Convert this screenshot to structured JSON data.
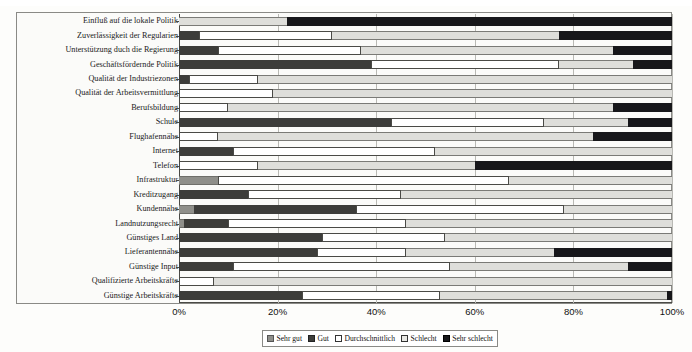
{
  "chart_data": {
    "type": "bar",
    "orientation": "horizontal",
    "stacked": true,
    "stack_mode": "percent",
    "title": "",
    "xlabel": "",
    "ylabel": "",
    "xlim": [
      0,
      100
    ],
    "grid": true,
    "legend_position": "bottom",
    "xticks": [
      "0%",
      "20%",
      "40%",
      "60%",
      "80%",
      "100%"
    ],
    "xtick_values": [
      0,
      20,
      40,
      60,
      80,
      100
    ],
    "series": [
      {
        "name": "Sehr gut",
        "color": "#8f8f8a"
      },
      {
        "name": "Gut",
        "color": "#3d3d3a"
      },
      {
        "name": "Durchschnittlich",
        "color": "#ffffff"
      },
      {
        "name": "Schlecht",
        "color": "#dededa"
      },
      {
        "name": "Sehr schlecht",
        "color": "#17171a"
      }
    ],
    "categories": [
      "Einfluß auf die lokale Politik",
      "Zuverlässigkeit der Regularien",
      "Unterstützung duch die Regierung",
      "Geschäftsfördernde Politik",
      "Qualität der Industriezonen",
      "Qualität der Arbeitsvermittlung",
      "Berufsbildung",
      "Schule",
      "Flughafennähe",
      "Internet",
      "Telefon",
      "Infrastruktur",
      "Kreditzugang",
      "Kundennähe",
      "Landnutzungsrecht",
      "Günstiges Land",
      "Lieferantennähe",
      "Günstige Input",
      "Qualifizierte Arbeitskräfte",
      "Günstige Arbeitskräfte"
    ],
    "values": [
      [
        0,
        0,
        0,
        22,
        78
      ],
      [
        0,
        4,
        27,
        46,
        23
      ],
      [
        0,
        8,
        29,
        51,
        12
      ],
      [
        0,
        39,
        38,
        15,
        8
      ],
      [
        0,
        2,
        14,
        84,
        0
      ],
      [
        0,
        0,
        19,
        81,
        0
      ],
      [
        0,
        0,
        10,
        78,
        12
      ],
      [
        0,
        43,
        31,
        17,
        9
      ],
      [
        0,
        0,
        8,
        76,
        16
      ],
      [
        0,
        11,
        41,
        48,
        0
      ],
      [
        0,
        0,
        16,
        44,
        40
      ],
      [
        8,
        0,
        59,
        33,
        0
      ],
      [
        0,
        14,
        31,
        55,
        0
      ],
      [
        3,
        33,
        42,
        22,
        0
      ],
      [
        1,
        9,
        36,
        54,
        0
      ],
      [
        0,
        29,
        25,
        46,
        0
      ],
      [
        0,
        28,
        18,
        30,
        24
      ],
      [
        0,
        11,
        44,
        36,
        9
      ],
      [
        0,
        0,
        7,
        93,
        0
      ],
      [
        0,
        25,
        28,
        46,
        1
      ]
    ],
    "series_label_note": "Segments ordered: Sehr gut, Gut, Durchschnittlich, Schlecht, Sehr schlecht"
  },
  "legend": {
    "items": [
      {
        "label": "Sehr gut",
        "swatch": "swatch-sehr-gut"
      },
      {
        "label": "Gut",
        "swatch": "swatch-gut"
      },
      {
        "label": "Durchschnittlich",
        "swatch": "swatch-durchschnittlich"
      },
      {
        "label": "Schlecht",
        "swatch": "swatch-schlecht"
      },
      {
        "label": "Sehr schlecht",
        "swatch": "swatch-sehr-schlecht"
      }
    ]
  }
}
